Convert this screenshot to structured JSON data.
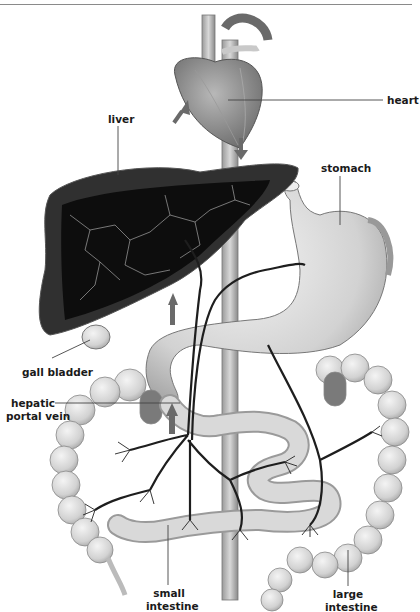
{
  "diagram": {
    "labels": {
      "heart": "heart",
      "liver": "liver",
      "stomach": "stomach",
      "gall_bladder": "gall bladder",
      "hepatic_portal_vein_line1": "hepatic",
      "hepatic_portal_vein_line2": "portal vein",
      "small_intestine_line1": "small",
      "small_intestine_line2": "intestine",
      "large_intestine_line1": "large",
      "large_intestine_line2": "intestine"
    },
    "colors": {
      "line": "#444444",
      "liver_interior": "#111111",
      "organ_fill": "#d9d9d9",
      "vessel": "#2a2a2a",
      "arrow": "#6a6a6a"
    }
  }
}
